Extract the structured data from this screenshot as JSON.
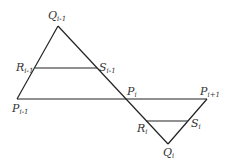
{
  "diagram": {
    "stroke_color": "#222222",
    "points": {
      "Q_prev": {
        "label": "Q",
        "sub": "i-1",
        "x": 58,
        "y": 26
      },
      "R_prev": {
        "label": "R",
        "sub": "i-1",
        "x": 35,
        "y": 68
      },
      "S_prev": {
        "label": "S",
        "sub": "i-1",
        "x": 97,
        "y": 68
      },
      "P_prev": {
        "label": "P",
        "sub": "i-1",
        "x": 17,
        "y": 99
      },
      "P_cur": {
        "label": "P",
        "sub": "i",
        "x": 125,
        "y": 99
      },
      "P_next": {
        "label": "P",
        "sub": "i+1",
        "x": 207,
        "y": 99
      },
      "R_cur": {
        "label": "R",
        "sub": "i",
        "x": 146,
        "y": 121
      },
      "S_cur": {
        "label": "S",
        "sub": "i",
        "x": 188,
        "y": 121
      },
      "Q_cur": {
        "label": "Q",
        "sub": "i",
        "x": 168,
        "y": 144
      }
    },
    "segments": [
      [
        "P_prev",
        "Q_prev"
      ],
      [
        "Q_prev",
        "Q_cur"
      ],
      [
        "R_prev",
        "S_prev"
      ],
      [
        "P_prev",
        "P_next"
      ],
      [
        "R_cur",
        "S_cur"
      ],
      [
        "P_next",
        "Q_cur"
      ]
    ]
  }
}
